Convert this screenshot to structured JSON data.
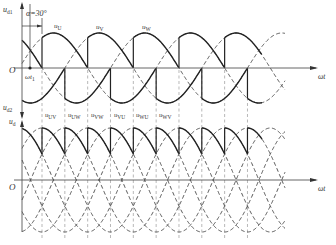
{
  "figure": {
    "top_panel": {
      "y_label_top": "u",
      "y_label_top_sub": "d1",
      "y_label_bottom": "u",
      "y_label_bottom_sub": "d2",
      "origin_label": "O",
      "x_label": "ωt",
      "alpha_label": "α=30°",
      "wt1_label": "ωt",
      "wt1_sub": "1",
      "phase_labels": [
        {
          "main": "u",
          "sub": "U"
        },
        {
          "main": "u",
          "sub": "V"
        },
        {
          "main": "u",
          "sub": "W"
        }
      ]
    },
    "bottom_panel": {
      "y_label": "u",
      "y_label_sub": "d",
      "origin_label": "O",
      "x_label": "ωt",
      "line_voltage_labels": [
        {
          "main": "u",
          "sub": "UV"
        },
        {
          "main": "u",
          "sub": "UW"
        },
        {
          "main": "u",
          "sub": "VW"
        },
        {
          "main": "u",
          "sub": "VU"
        },
        {
          "main": "u",
          "sub": "WU"
        },
        {
          "main": "u",
          "sub": "WV"
        }
      ]
    },
    "colors": {
      "stroke": "#222222",
      "dashed": "#444444",
      "guide": "#888888",
      "axis": "#555555",
      "background": "#ffffff"
    }
  }
}
